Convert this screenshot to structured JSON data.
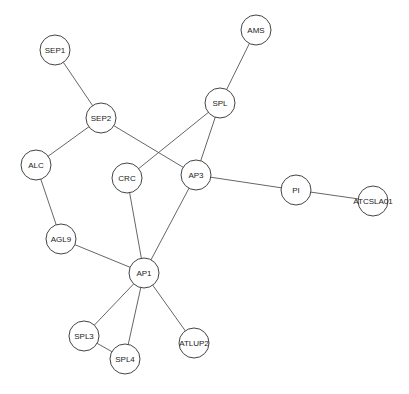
{
  "graph": {
    "node_radius": 15,
    "colors": {
      "edge": "#555555",
      "node_stroke": "#444444",
      "node_fill": "#ffffff",
      "label": "#222222"
    },
    "nodes": [
      {
        "id": "SEP1",
        "label": "SEP1",
        "x": 55,
        "y": 50
      },
      {
        "id": "SEP2",
        "label": "SEP2",
        "x": 101,
        "y": 118
      },
      {
        "id": "ALC",
        "label": "ALC",
        "x": 36,
        "y": 165
      },
      {
        "id": "CRC",
        "label": "CRC",
        "x": 127,
        "y": 178
      },
      {
        "id": "AP3",
        "label": "AP3",
        "x": 196,
        "y": 175
      },
      {
        "id": "AMS",
        "label": "AMS",
        "x": 256,
        "y": 30
      },
      {
        "id": "SPL",
        "label": "SPL",
        "x": 220,
        "y": 103
      },
      {
        "id": "PI",
        "label": "PI",
        "x": 296,
        "y": 190
      },
      {
        "id": "ATCSLA01",
        "label": "ATCSLA01",
        "x": 373,
        "y": 201
      },
      {
        "id": "AGL9",
        "label": "AGL9",
        "x": 61,
        "y": 239
      },
      {
        "id": "AP1",
        "label": "AP1",
        "x": 144,
        "y": 273
      },
      {
        "id": "SPL3",
        "label": "SPL3",
        "x": 84,
        "y": 336
      },
      {
        "id": "SPL4",
        "label": "SPL4",
        "x": 125,
        "y": 359
      },
      {
        "id": "ATLUP2",
        "label": "ATLUP2",
        "x": 194,
        "y": 343
      }
    ],
    "edges": [
      [
        "SEP1",
        "SEP2"
      ],
      [
        "SEP2",
        "ALC"
      ],
      [
        "SEP2",
        "AP3"
      ],
      [
        "ALC",
        "AGL9"
      ],
      [
        "AGL9",
        "AP1"
      ],
      [
        "CRC",
        "SPL"
      ],
      [
        "CRC",
        "AP1"
      ],
      [
        "AMS",
        "SPL"
      ],
      [
        "SPL",
        "AP3"
      ],
      [
        "AP3",
        "PI"
      ],
      [
        "AP3",
        "AP1"
      ],
      [
        "PI",
        "ATCSLA01"
      ],
      [
        "AP1",
        "SPL3"
      ],
      [
        "AP1",
        "SPL4"
      ],
      [
        "AP1",
        "ATLUP2"
      ],
      [
        "SPL3",
        "SPL4"
      ]
    ]
  }
}
